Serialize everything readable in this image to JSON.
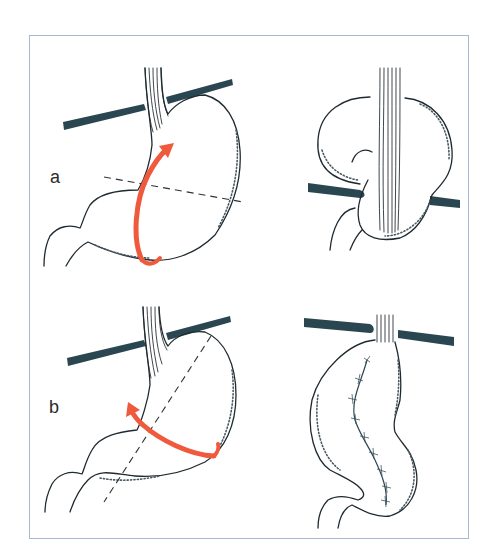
{
  "figure": {
    "frame_color": "#aab6d4",
    "panels": [
      {
        "id": "a",
        "label": "a",
        "left_view": "stomach-with-dashed-transverse-cut-and-upward-rotation-arrow",
        "right_view": "stomach-folded-upward-through-diaphragm"
      },
      {
        "id": "b",
        "label": "b",
        "left_view": "stomach-with-dashed-oblique-cut-and-leftward-rotation-arrow",
        "right_view": "elongated-stomach-with-sutured-staple-line"
      }
    ],
    "colors": {
      "arrow": "#f05a3c",
      "diaphragm": "#2a4650",
      "outline": "#1f2a30",
      "suture": "#2e4650"
    },
    "icons": {
      "arrow_a": "curved-arrow-up-icon",
      "arrow_b": "curved-arrow-left-icon"
    }
  }
}
